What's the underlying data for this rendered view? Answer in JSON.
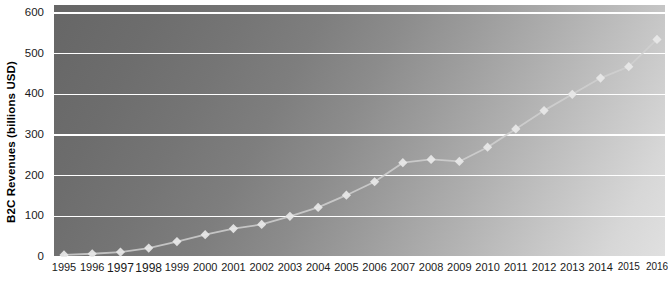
{
  "chart_data": {
    "type": "line",
    "title": "",
    "subtitle": "",
    "xlabel": "",
    "ylabel": "B2C Revenues (billions USD)",
    "ylim": [
      0,
      600
    ],
    "ytick_labels": [
      "0",
      "100",
      "200",
      "300",
      "400",
      "500",
      "600"
    ],
    "ytick_values": [
      0,
      100,
      200,
      300,
      400,
      500,
      600
    ],
    "grid": "horizontal",
    "legend": "none",
    "marker": "diamond",
    "categories": [
      "1995",
      "1996",
      "1997",
      "1998",
      "1999",
      "2000",
      "2001",
      "2002",
      "2003",
      "2004",
      "2005",
      "2006",
      "2007",
      "2008",
      "2009",
      "2010",
      "2011",
      "2012",
      "2013",
      "2014",
      "2015",
      "2016"
    ],
    "x": [
      1995,
      1996,
      1997,
      1998,
      1999,
      2000,
      2001,
      2002,
      2003,
      2004,
      2005,
      2006,
      2007,
      2008,
      2009,
      2010,
      2011,
      2012,
      2013,
      2014,
      2015,
      2016
    ],
    "values": [
      5,
      8,
      12,
      22,
      38,
      55,
      70,
      80,
      100,
      122,
      152,
      185,
      232,
      240,
      235,
      270,
      315,
      360,
      400,
      440,
      468,
      535
    ],
    "series": [
      {
        "name": "B2C Revenues",
        "color": "#d8d8d8",
        "values": [
          5,
          8,
          12,
          22,
          38,
          55,
          70,
          80,
          100,
          122,
          152,
          185,
          232,
          240,
          235,
          270,
          315,
          360,
          400,
          440,
          468,
          535
        ]
      }
    ]
  },
  "style": {
    "gridline_color": "#ffffff",
    "line_color": "#d0d0d0",
    "marker_color": "#e8e8e8",
    "plot_bg_dark": "#666666",
    "plot_bg_light": "#e0e0e0",
    "text_color": "#1a1a1a"
  }
}
